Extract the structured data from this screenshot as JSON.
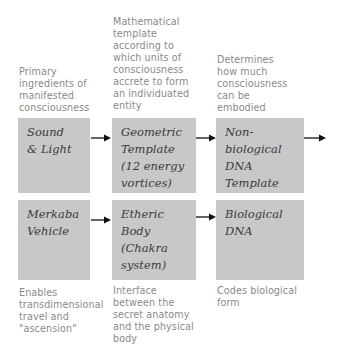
{
  "diagram": {
    "top_captions": [
      "Primary\ningredients of\nmanifested\nconsciousness",
      "Mathematical\ntemplate\naccording to\nwhich units of\nconsciousness\naccrete to form\nan individuated\nentity",
      "Determines\nhow much\nconsciousness\ncan be\nembodied"
    ],
    "row1_boxes": [
      "Sound\n& Light",
      "Geometric\nTemplate\n(12 energy\nvortices)",
      "Non-\nbiological\nDNA\nTemplate"
    ],
    "row2_boxes": [
      "Merkaba\nVehicle",
      "Etheric\nBody\n(Chakra\nsystem)",
      "Biological\nDNA"
    ],
    "bottom_captions": [
      "Enables\ntransdimensional\ntravel and\n\"ascension\"",
      "Interface\nbetween the\nsecret anatomy\nand the physical\nbody",
      "Codes biological\nform"
    ],
    "arrows": [
      {
        "from": "Sound & Light",
        "to": "Geometric Template (12 energy vortices)"
      },
      {
        "from": "Geometric Template (12 energy vortices)",
        "to": "Non-biological DNA Template"
      },
      {
        "from": "Non-biological DNA Template",
        "to": "(continues)"
      },
      {
        "from": "Merkaba Vehicle",
        "to": "Etheric Body (Chakra system)"
      },
      {
        "from": "Etheric Body (Chakra system)",
        "to": "Biological DNA"
      }
    ],
    "colors": {
      "box_fill": "#c8c8c8",
      "box_text": "#3a3a3a",
      "caption_text": "#8a8a8a",
      "arrow": "#111111"
    }
  }
}
